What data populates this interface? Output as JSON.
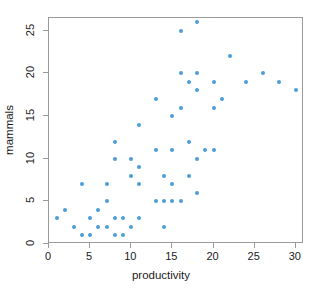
{
  "chart_data": {
    "type": "scatter",
    "title": "",
    "xlabel": "productivity",
    "ylabel": "mammals",
    "xlim": [
      0,
      31
    ],
    "ylim": [
      0,
      26.5
    ],
    "xticks": [
      0,
      5,
      10,
      15,
      20,
      25,
      30
    ],
    "yticks": [
      0,
      5,
      10,
      15,
      20,
      25
    ],
    "xticklabels": [
      "0",
      "5",
      "10",
      "15",
      "20",
      "25",
      "30"
    ],
    "yticklabels": [
      "0",
      "5",
      "10",
      "15",
      "20",
      "25"
    ],
    "grid": false,
    "legend": false,
    "point_color": "#4a9fd8",
    "frame_color": "#9a9a9a",
    "series": [
      {
        "name": "mammals vs productivity",
        "points": [
          [
            1,
            3
          ],
          [
            2,
            4
          ],
          [
            3,
            2
          ],
          [
            4,
            1
          ],
          [
            4,
            7
          ],
          [
            5,
            3
          ],
          [
            5,
            1
          ],
          [
            6,
            4
          ],
          [
            6,
            2
          ],
          [
            7,
            5
          ],
          [
            7,
            2
          ],
          [
            7,
            7
          ],
          [
            8,
            1
          ],
          [
            8,
            3
          ],
          [
            8,
            10
          ],
          [
            8,
            12
          ],
          [
            9,
            1
          ],
          [
            9,
            3
          ],
          [
            10,
            2
          ],
          [
            10,
            8
          ],
          [
            10,
            10
          ],
          [
            11,
            3
          ],
          [
            11,
            7
          ],
          [
            11,
            9
          ],
          [
            11,
            14
          ],
          [
            13,
            5
          ],
          [
            13,
            11
          ],
          [
            13,
            17
          ],
          [
            14,
            2
          ],
          [
            14,
            5
          ],
          [
            14,
            8
          ],
          [
            15,
            5
          ],
          [
            15,
            7
          ],
          [
            15,
            11
          ],
          [
            15,
            15
          ],
          [
            16,
            5
          ],
          [
            16,
            16
          ],
          [
            16,
            20
          ],
          [
            16,
            25
          ],
          [
            17,
            8
          ],
          [
            17,
            12
          ],
          [
            17,
            19
          ],
          [
            18,
            6
          ],
          [
            18,
            10
          ],
          [
            18,
            18
          ],
          [
            18,
            20
          ],
          [
            18,
            26
          ],
          [
            19,
            11
          ],
          [
            20,
            11
          ],
          [
            20,
            16
          ],
          [
            20,
            19
          ],
          [
            21,
            17
          ],
          [
            22,
            22
          ],
          [
            24,
            19
          ],
          [
            26,
            20
          ],
          [
            28,
            19
          ],
          [
            30,
            18
          ]
        ]
      }
    ]
  }
}
